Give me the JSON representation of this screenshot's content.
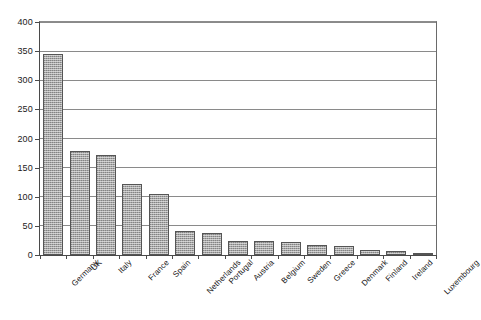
{
  "chart_data": {
    "type": "bar",
    "title": "",
    "subtitle": "",
    "xlabel": "",
    "ylabel": "",
    "categories": [
      "Germany",
      "UK",
      "Italy",
      "France",
      "Spain",
      "Netherlands",
      "Portugal",
      "Austria",
      "Belgium",
      "Sweden",
      "Greece",
      "Denmark",
      "Finland",
      "Ireland",
      "Luxembourg"
    ],
    "values": [
      345,
      178,
      171,
      122,
      104,
      42,
      37,
      24,
      24,
      22,
      17,
      16,
      9,
      7,
      2
    ],
    "ylim": [
      0,
      400
    ],
    "yticks": [
      0,
      50,
      100,
      150,
      200,
      250,
      300,
      350,
      400
    ],
    "ytick_labels": [
      "0",
      "50",
      "100",
      "150",
      "200",
      "250",
      "300",
      "350",
      "400"
    ],
    "grid": true,
    "grid_axis": "y",
    "legend": false,
    "legend_position": "none",
    "bar_color": "#a6a6a6",
    "bar_edge_color": "#555555",
    "axis_color": "#4a4a4a",
    "gridline_color": "#8a8a8a",
    "background_color": "#ffffff",
    "tick_label_rotation": -45,
    "series": [
      {
        "name": "",
        "values": [
          345,
          178,
          171,
          122,
          104,
          42,
          37,
          24,
          24,
          22,
          17,
          16,
          9,
          7,
          2
        ]
      }
    ]
  }
}
